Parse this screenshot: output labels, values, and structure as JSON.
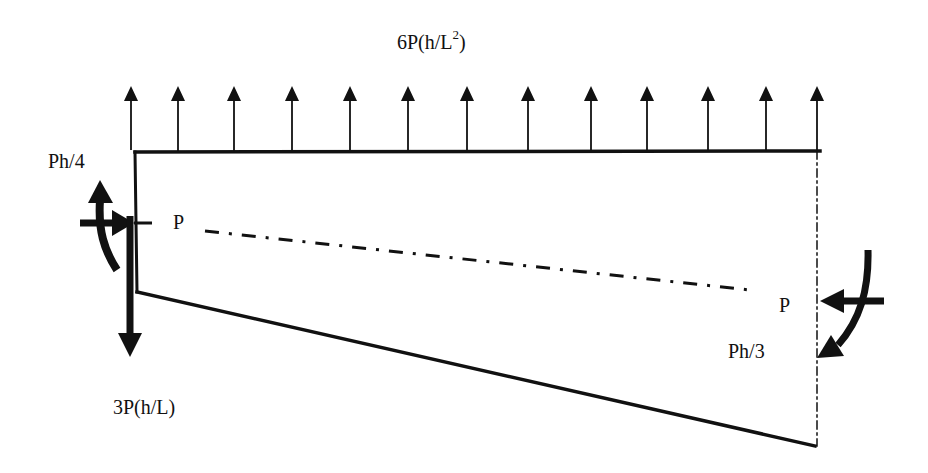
{
  "diagram": {
    "type": "free-body diagram",
    "labels": {
      "distributed_load": "6P(h/L",
      "distributed_load_exponent": "2",
      "distributed_load_close": ")",
      "left_moment": "Ph/4",
      "left_axial_force": "P",
      "left_shear_force": "3P(h/L)",
      "right_axial_force": "P",
      "right_moment": "Ph/3"
    },
    "distributed_arrows_x": [
      131,
      178,
      234,
      292,
      350,
      408,
      467,
      528,
      591,
      647,
      708,
      766,
      817
    ],
    "colors": {
      "line": "#111111",
      "background": "#ffffff"
    }
  }
}
